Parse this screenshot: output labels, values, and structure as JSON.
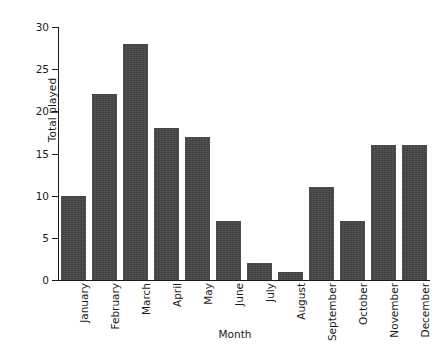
{
  "figure": {
    "background_color": "#ffffff",
    "bar_color": "#474747",
    "axis_color": "#1a1a1a",
    "top_cropped_text": ""
  },
  "chart_data": {
    "type": "bar",
    "title": "",
    "xlabel": "Month",
    "ylabel": "Total played",
    "categories": [
      "January",
      "February",
      "March",
      "April",
      "May",
      "June",
      "July",
      "August",
      "September",
      "October",
      "November",
      "December"
    ],
    "values": [
      10,
      22,
      28,
      18,
      17,
      7,
      2,
      1,
      11,
      7,
      16,
      16
    ],
    "ylim": [
      0,
      30
    ],
    "yticks": [
      0,
      5,
      10,
      15,
      20,
      25,
      30
    ],
    "ytick_labels": [
      "0",
      "5",
      "10",
      "15",
      "20",
      "25",
      "30"
    ],
    "grid": false,
    "legend": false,
    "bar_orientation": "vertical",
    "bar_width_fraction": 0.8
  }
}
